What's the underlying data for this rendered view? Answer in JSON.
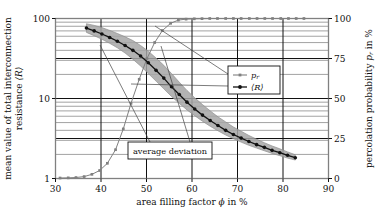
{
  "figure": {
    "name": "percolation-resistance-figure",
    "background": "#ffffff",
    "frame_color": "#808080",
    "gridline_color": "#111111",
    "minor_gridline_color": "#8a8a8a",
    "series_colors": {
      "pr": "#808080",
      "R": "#111111",
      "band": "#a6a6a6"
    }
  },
  "axes": {
    "x": {
      "title_plain": "area filling factor",
      "title_symbol": "ϕ",
      "title_unit": "in %",
      "ticks": [
        30,
        40,
        50,
        60,
        70,
        80,
        90
      ],
      "tick_labels": [
        "30",
        "40",
        "50",
        "60",
        "70",
        "80",
        "90"
      ],
      "min": 30,
      "max": 90
    },
    "y_left": {
      "title_line1": "mean value of total interconnection",
      "title_line2_plain": "resistance",
      "title_line2_symbol": "⟨R⟩",
      "ticks": [
        1,
        10,
        100
      ],
      "tick_labels": [
        "1",
        "10",
        "100"
      ],
      "min": 1,
      "max": 100,
      "scale": "log"
    },
    "y_right": {
      "title_plain": "percolation probability",
      "title_symbol": "p",
      "title_subscript": "r",
      "title_unit": "in %",
      "ticks": [
        0,
        25,
        50,
        75,
        100
      ],
      "tick_labels": [
        "0",
        "25",
        "50",
        "75",
        "100"
      ],
      "min": 0,
      "max": 100,
      "scale": "linear"
    }
  },
  "legend": {
    "name": "series-legend",
    "entries": [
      {
        "symbol": "p",
        "subscript": "r",
        "label": "p_r",
        "color": "#808080",
        "marker": "square"
      },
      {
        "symbol": "⟨R⟩",
        "subscript": "",
        "label": "⟨R⟩",
        "color": "#111111",
        "marker": "circle"
      }
    ]
  },
  "annotations": [
    {
      "name": "average-deviation-callout",
      "text": "average deviation"
    }
  ],
  "chart_data": {
    "type": "line",
    "title": "",
    "xlabel": "area filling factor ϕ in %",
    "ylabel": "mean value of total interconnection resistance ⟨R⟩",
    "ylabel_right": "percolation probability p_r in %",
    "xlim": [
      30,
      90
    ],
    "ylim_left": [
      1,
      100
    ],
    "ylim_right": [
      0,
      100
    ],
    "yscale_left": "log",
    "grid": true,
    "legend_position": "center-right",
    "series": [
      {
        "name": "p_r",
        "axis": "right",
        "color": "#808080",
        "marker": "square",
        "x": [
          31.0,
          32.8,
          34.5,
          36.3,
          38.0,
          39.7,
          41.4,
          43.2,
          44.9,
          46.6,
          48.4,
          50.1,
          51.8,
          53.5,
          55.3,
          57.0,
          58.7,
          60.5,
          62.2,
          63.9,
          65.6,
          67.4,
          69.1,
          70.8,
          72.6,
          74.3,
          76.0,
          77.7,
          79.5,
          81.2,
          82.9,
          84.6
        ],
        "values": [
          0.3,
          0.4,
          0.6,
          1.2,
          2.6,
          5.0,
          9.5,
          18.0,
          31.0,
          47.0,
          62.0,
          75.0,
          85.0,
          92.5,
          97.0,
          99.0,
          99.6,
          99.8,
          99.9,
          100.0,
          100.0,
          100.0,
          100.0,
          100.0,
          100.0,
          100.0,
          100.0,
          100.0,
          100.0,
          100.0,
          100.0,
          100.0
        ]
      },
      {
        "name": "⟨R⟩",
        "axis": "left",
        "color": "#111111",
        "marker": "circle",
        "x": [
          36.8,
          38.5,
          40.2,
          41.9,
          43.6,
          45.3,
          47.0,
          48.7,
          50.4,
          52.1,
          53.8,
          55.5,
          57.2,
          58.9,
          60.6,
          62.3,
          64.0,
          65.7,
          67.4,
          69.1,
          70.8,
          72.5,
          74.2,
          75.9,
          77.6,
          79.3,
          81.0,
          82.7
        ],
        "values": [
          76.0,
          70.0,
          64.0,
          58.0,
          52.0,
          46.0,
          40.0,
          34.0,
          28.0,
          22.5,
          18.0,
          14.0,
          11.2,
          9.0,
          7.4,
          6.2,
          5.3,
          4.6,
          4.0,
          3.55,
          3.2,
          2.9,
          2.65,
          2.45,
          2.25,
          2.1,
          1.95,
          1.82
        ]
      },
      {
        "name": "average deviation band upper",
        "axis": "left",
        "color": "#a6a6a6",
        "marker": "none",
        "x": [
          36.8,
          38.5,
          40.2,
          41.9,
          43.6,
          45.3,
          47.0,
          48.7,
          50.4,
          52.1,
          53.8,
          55.5,
          57.2,
          58.9,
          60.6,
          62.3,
          64.0,
          65.7,
          67.4,
          69.1,
          70.8,
          72.5,
          74.2,
          75.9,
          77.6,
          79.3,
          81.0,
          82.7
        ],
        "values": [
          86.0,
          82.0,
          77.0,
          71.0,
          65.0,
          59.0,
          53.0,
          46.0,
          39.0,
          32.0,
          26.0,
          20.5,
          16.0,
          12.6,
          10.2,
          8.4,
          7.0,
          5.9,
          5.1,
          4.4,
          3.9,
          3.45,
          3.1,
          2.8,
          2.55,
          2.35,
          2.15,
          1.98
        ]
      },
      {
        "name": "average deviation band lower",
        "axis": "left",
        "color": "#a6a6a6",
        "marker": "none",
        "x": [
          36.8,
          38.5,
          40.2,
          41.9,
          43.6,
          45.3,
          47.0,
          48.7,
          50.4,
          52.1,
          53.8,
          55.5,
          57.2,
          58.9,
          60.6,
          62.3,
          64.0,
          65.7,
          67.4,
          69.1,
          70.8,
          72.5,
          74.2,
          75.9,
          77.6,
          79.3,
          81.0,
          82.7
        ],
        "values": [
          67.0,
          61.0,
          55.0,
          49.0,
          43.0,
          37.0,
          31.0,
          25.5,
          20.5,
          16.5,
          13.2,
          10.6,
          8.7,
          7.2,
          6.1,
          5.2,
          4.5,
          3.95,
          3.5,
          3.15,
          2.85,
          2.6,
          2.4,
          2.22,
          2.06,
          1.93,
          1.8,
          1.7
        ]
      }
    ],
    "minor_gridlines_left": [
      2,
      3,
      4,
      5,
      6,
      7,
      8,
      9,
      20,
      30,
      40,
      50,
      60,
      70,
      80,
      90
    ]
  }
}
